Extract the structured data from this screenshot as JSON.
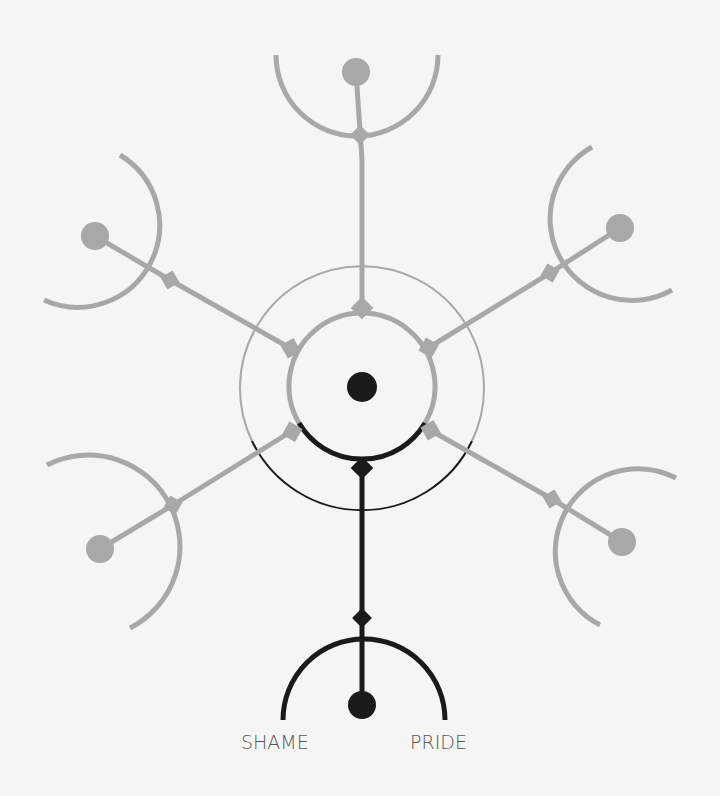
{
  "diagram": {
    "type": "radial-branching-emotion-diagram",
    "center": {
      "x": 362,
      "y": 387
    },
    "colors": {
      "background": "#f5f5f3",
      "active": "#1a1a1a",
      "inactive": "#a8a8a8",
      "label": "#555555"
    },
    "inner_ring_radius": 73,
    "outer_ring_radius": 122,
    "branches": [
      {
        "id": "top",
        "angle_deg": -90,
        "active": false
      },
      {
        "id": "upper-right",
        "angle_deg": -30,
        "active": false
      },
      {
        "id": "lower-right",
        "angle_deg": 30,
        "active": false
      },
      {
        "id": "bottom",
        "angle_deg": 90,
        "active": true
      },
      {
        "id": "lower-left",
        "angle_deg": 150,
        "active": false
      },
      {
        "id": "upper-left",
        "angle_deg": 210,
        "active": false
      }
    ],
    "labels": {
      "left": "SHAME",
      "right": "PRIDE"
    }
  }
}
